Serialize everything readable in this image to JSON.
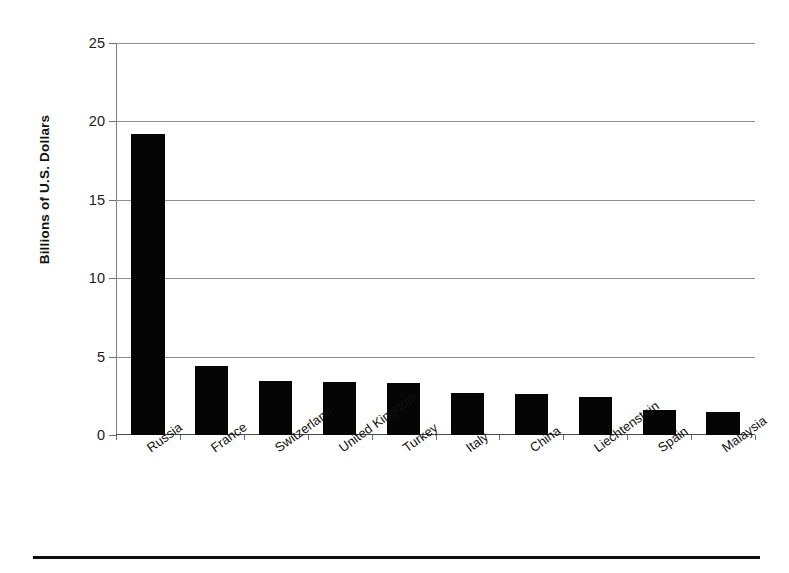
{
  "chart_data": {
    "type": "bar",
    "title": "",
    "subtitle": "",
    "xlabel": "",
    "ylabel": "Billions of U.S. Dollars",
    "categories": [
      "Russia",
      "France",
      "Switzerland",
      "United Kingdom",
      "Turkey",
      "Italy",
      "China",
      "Liechtenstein",
      "Spain",
      "Malaysia"
    ],
    "values": [
      19.2,
      4.4,
      3.45,
      3.35,
      3.3,
      2.7,
      2.6,
      2.45,
      1.6,
      1.45
    ],
    "series": [
      {
        "name": "",
        "values": [
          19.2,
          4.4,
          3.45,
          3.35,
          3.3,
          2.7,
          2.6,
          2.45,
          1.6,
          1.45
        ]
      }
    ],
    "ylim": [
      0,
      25
    ],
    "yticks": [
      0,
      5,
      10,
      15,
      20,
      25
    ],
    "ytick_labels": [
      "0",
      "5",
      "10",
      "15",
      "20",
      "25"
    ],
    "grid": true,
    "grid_axis": "y",
    "legend": false,
    "legend_position": "none",
    "bar_color": "#050505",
    "gridline_color": "#8d8d8d",
    "axis_color": "#4a4a4a",
    "background_color": "#ffffff",
    "xtick_label_rotation": -36,
    "bar_count": 10
  },
  "axes": {
    "y": {
      "label": "Billions of U.S. Dollars",
      "ticks": [
        {
          "value": 25,
          "label": "25"
        },
        {
          "value": 20,
          "label": "20"
        },
        {
          "value": 15,
          "label": "15"
        },
        {
          "value": 10,
          "label": "10"
        },
        {
          "value": 5,
          "label": "5"
        },
        {
          "value": 0,
          "label": "0"
        }
      ]
    },
    "x": {
      "label": "",
      "ticks": [
        {
          "label": "Russia"
        },
        {
          "label": "France"
        },
        {
          "label": "Switzerland"
        },
        {
          "label": "United Kingdom"
        },
        {
          "label": "Turkey"
        },
        {
          "label": "Italy"
        },
        {
          "label": "China"
        },
        {
          "label": "Liechtenstein"
        },
        {
          "label": "Spain"
        },
        {
          "label": "Malaysia"
        }
      ]
    }
  }
}
